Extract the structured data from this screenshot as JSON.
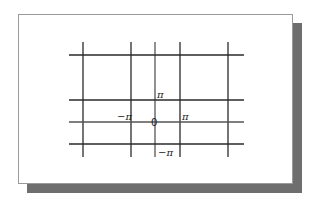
{
  "diagram": {
    "type": "grid-lattice",
    "colors": {
      "background": "#ffffff",
      "panel_border": "#9a9a9a",
      "shadow": "#6e6e6e",
      "lines": "#2a2a2a"
    },
    "vertical_lines_x": [
      83,
      131,
      155,
      180,
      228
    ],
    "horizontal_lines_y": [
      55,
      100,
      122,
      144
    ],
    "labels": {
      "top": "π",
      "left": "−π",
      "origin": "0",
      "right": "π",
      "bottom": "−π"
    }
  }
}
